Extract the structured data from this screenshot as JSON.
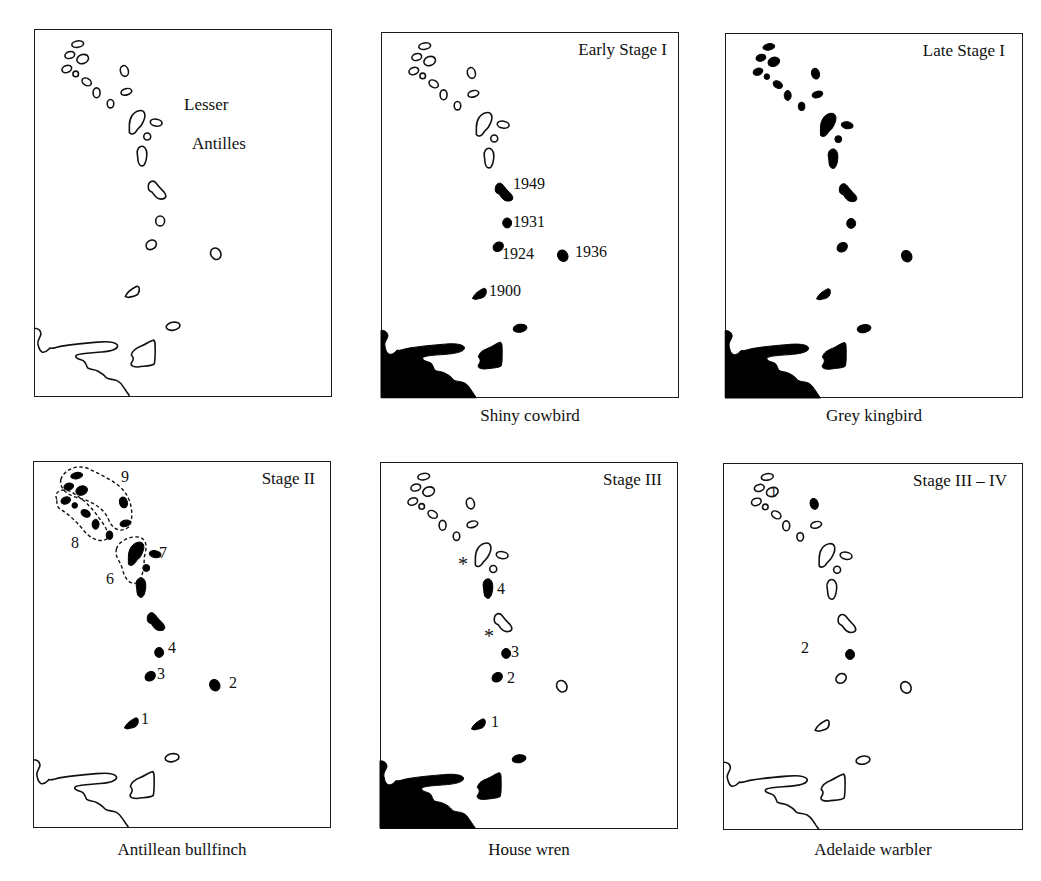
{
  "figure": {
    "region_label": [
      "Lesser",
      "Antilles"
    ],
    "panels": [
      {
        "id": "base",
        "stage": "",
        "species": "",
        "labels": []
      },
      {
        "id": "shiny-cowbird",
        "stage": "Early Stage I",
        "species": "Shiny cowbird",
        "labels": [
          "1949",
          "1931",
          "1924",
          "1936",
          "1900"
        ]
      },
      {
        "id": "grey-kingbird",
        "stage": "Late Stage I",
        "species": "Grey kingbird",
        "labels": []
      },
      {
        "id": "antillean-bullfinch",
        "stage": "Stage II",
        "species": "Antillean bullfinch",
        "labels": [
          "9",
          "8",
          "7",
          "6",
          "4",
          "3",
          "2",
          "1"
        ]
      },
      {
        "id": "house-wren",
        "stage": "Stage III",
        "species": "House wren",
        "labels": [
          "4",
          "3",
          "2",
          "1",
          "*",
          "*"
        ]
      },
      {
        "id": "adelaide-warbler",
        "stage": "Stage III – IV",
        "species": "Adelaide warbler",
        "labels": [
          "1",
          "2"
        ]
      }
    ]
  }
}
